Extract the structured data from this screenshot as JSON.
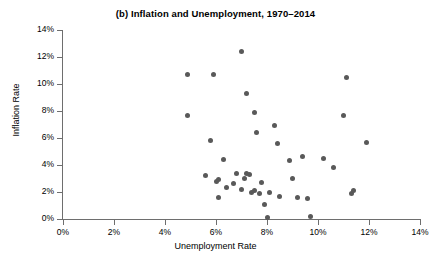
{
  "chart_data": {
    "type": "scatter",
    "title": "(b) Inflation and Unemployment, 1970–2014",
    "xlabel": "Unemployment Rate",
    "ylabel": "Inflation Rate",
    "xlim": [
      0,
      14
    ],
    "ylim": [
      0,
      14
    ],
    "grid": false,
    "legend": null,
    "xticks": [
      "0%",
      "2%",
      "4%",
      "6%",
      "8%",
      "10%",
      "12%",
      "14%"
    ],
    "xtick_values": [
      0,
      2,
      4,
      6,
      8,
      10,
      12,
      14
    ],
    "yticks": [
      "0%",
      "2%",
      "4%",
      "6%",
      "8%",
      "10%",
      "12%",
      "14%"
    ],
    "ytick_values": [
      0,
      2,
      4,
      6,
      8,
      10,
      12,
      14
    ],
    "marker_color": "#595959",
    "axis_color": "#6e6e6e",
    "series": [
      {
        "name": "Year observations",
        "points": [
          {
            "x": 4.9,
            "y": 10.7
          },
          {
            "x": 4.9,
            "y": 7.7
          },
          {
            "x": 5.6,
            "y": 3.2
          },
          {
            "x": 5.8,
            "y": 5.8
          },
          {
            "x": 5.9,
            "y": 10.7
          },
          {
            "x": 6.0,
            "y": 2.8
          },
          {
            "x": 6.1,
            "y": 2.9
          },
          {
            "x": 6.1,
            "y": 1.6
          },
          {
            "x": 6.3,
            "y": 4.4
          },
          {
            "x": 6.4,
            "y": 2.3
          },
          {
            "x": 6.7,
            "y": 2.6
          },
          {
            "x": 6.8,
            "y": 3.4
          },
          {
            "x": 7.0,
            "y": 12.4
          },
          {
            "x": 7.0,
            "y": 2.2
          },
          {
            "x": 7.1,
            "y": 3.0
          },
          {
            "x": 7.2,
            "y": 9.3
          },
          {
            "x": 7.2,
            "y": 3.4
          },
          {
            "x": 7.3,
            "y": 3.3
          },
          {
            "x": 7.4,
            "y": 2.0
          },
          {
            "x": 7.5,
            "y": 2.1
          },
          {
            "x": 7.5,
            "y": 7.9
          },
          {
            "x": 7.6,
            "y": 6.4
          },
          {
            "x": 7.7,
            "y": 1.9
          },
          {
            "x": 7.8,
            "y": 2.7
          },
          {
            "x": 7.9,
            "y": 1.1
          },
          {
            "x": 8.0,
            "y": 0.1
          },
          {
            "x": 8.1,
            "y": 2.0
          },
          {
            "x": 8.3,
            "y": 6.9
          },
          {
            "x": 8.4,
            "y": 5.6
          },
          {
            "x": 8.5,
            "y": 1.7
          },
          {
            "x": 8.9,
            "y": 4.3
          },
          {
            "x": 9.0,
            "y": 3.0
          },
          {
            "x": 9.2,
            "y": 1.6
          },
          {
            "x": 9.4,
            "y": 4.6
          },
          {
            "x": 9.6,
            "y": 1.5
          },
          {
            "x": 9.7,
            "y": 0.2
          },
          {
            "x": 10.2,
            "y": 4.5
          },
          {
            "x": 10.6,
            "y": 3.8
          },
          {
            "x": 11.0,
            "y": 7.7
          },
          {
            "x": 11.1,
            "y": 10.5
          },
          {
            "x": 11.3,
            "y": 1.9
          },
          {
            "x": 11.4,
            "y": 2.1
          },
          {
            "x": 11.9,
            "y": 5.7
          }
        ]
      }
    ]
  }
}
